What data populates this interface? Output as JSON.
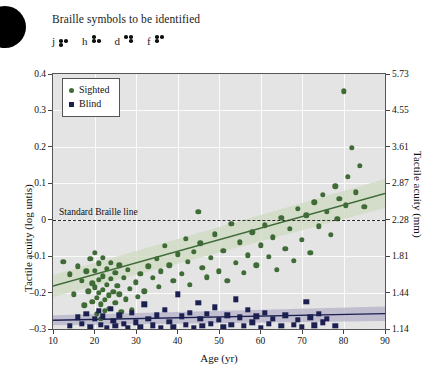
{
  "header": {
    "title": "Braille symbols to be identified",
    "braille_symbols": [
      {
        "letter": "j",
        "dots": [
          2,
          3,
          5
        ]
      },
      {
        "letter": "h",
        "dots": [
          1,
          2,
          5
        ]
      },
      {
        "letter": "d",
        "dots": [
          1,
          4,
          5
        ]
      },
      {
        "letter": "f",
        "dots": [
          1,
          2,
          4
        ]
      }
    ]
  },
  "legend": {
    "position": "top-left-inside",
    "items": [
      {
        "label": "Sighted",
        "marker": "circle",
        "color": "#3f6b36"
      },
      {
        "label": "Blind",
        "marker": "square",
        "color": "#1b2050"
      }
    ]
  },
  "annotation": {
    "braille_line_label": "Standard Braille line",
    "braille_line_y": 0
  },
  "colors": {
    "sighted": "#3f6b36",
    "sighted_band": "#cfdcc4",
    "blind": "#1b2050",
    "blind_band": "#b9b6cc",
    "plot_background": "#e4e4e4",
    "gridline": "#fbfbfb",
    "axis": "#555555"
  },
  "chart_data": {
    "type": "scatter",
    "title": "",
    "xlabel": "Age (yr)",
    "ylabel": "Tactile acuity (log untis)",
    "y2label": "Tactile acuity (mm)",
    "xlim": [
      10,
      90
    ],
    "ylim": [
      -0.3,
      0.4
    ],
    "grid": true,
    "xticks": [
      10,
      20,
      30,
      40,
      50,
      60,
      70,
      80,
      90
    ],
    "xticklabels": [
      "10",
      "20",
      "30",
      "40",
      "50",
      "60",
      "70",
      "80",
      "90"
    ],
    "yticks": [
      0.4,
      0.3,
      0.2,
      0.1,
      0,
      -0.1,
      -0.2,
      -0.3
    ],
    "yticklabels": [
      "0.4",
      "0.3",
      "0.2",
      "0.1",
      "0",
      "–0.1",
      "–0.2",
      "–0.3"
    ],
    "y2ticks": [
      0.4,
      0.3,
      0.2,
      0.1,
      0,
      -0.1,
      -0.2,
      -0.3
    ],
    "y2ticklabels": [
      "5.73",
      "4.55",
      "3.61",
      "2.87",
      "2.28",
      "1.81",
      "1.44",
      "1.14"
    ],
    "series": [
      {
        "name": "Sighted",
        "marker": "circle",
        "color": "#3f6b36",
        "trend": {
          "x": [
            10,
            90
          ],
          "y": [
            -0.182,
            0.072
          ]
        },
        "band_upper": {
          "x": [
            10,
            90
          ],
          "y": [
            -0.152,
            0.112
          ]
        },
        "band_lower": {
          "x": [
            10,
            90
          ],
          "y": [
            -0.212,
            0.032
          ]
        },
        "points": [
          [
            12.5,
            -0.115
          ],
          [
            14.0,
            -0.15
          ],
          [
            15.0,
            -0.205
          ],
          [
            16.0,
            -0.128
          ],
          [
            17.0,
            -0.168
          ],
          [
            17.5,
            -0.235
          ],
          [
            18.0,
            -0.142
          ],
          [
            18.5,
            -0.196
          ],
          [
            19.0,
            -0.108
          ],
          [
            19.5,
            -0.175
          ],
          [
            19.5,
            -0.225
          ],
          [
            20.0,
            -0.09
          ],
          [
            20.0,
            -0.14
          ],
          [
            20.0,
            -0.186
          ],
          [
            20.5,
            -0.215
          ],
          [
            20.5,
            -0.258
          ],
          [
            21.0,
            -0.12
          ],
          [
            21.0,
            -0.165
          ],
          [
            21.0,
            -0.2
          ],
          [
            21.5,
            -0.232
          ],
          [
            21.5,
            -0.272
          ],
          [
            22.0,
            -0.105
          ],
          [
            22.0,
            -0.155
          ],
          [
            22.0,
            -0.192
          ],
          [
            22.5,
            -0.22
          ],
          [
            22.5,
            -0.25
          ],
          [
            23.0,
            -0.135
          ],
          [
            23.0,
            -0.178
          ],
          [
            23.5,
            -0.208
          ],
          [
            23.5,
            -0.245
          ],
          [
            24.0,
            -0.118
          ],
          [
            24.0,
            -0.162
          ],
          [
            24.5,
            -0.198
          ],
          [
            25.0,
            -0.145
          ],
          [
            25.0,
            -0.228
          ],
          [
            25.5,
            -0.182
          ],
          [
            26.0,
            -0.125
          ],
          [
            26.0,
            -0.205
          ],
          [
            26.5,
            -0.252
          ],
          [
            27.0,
            -0.16
          ],
          [
            27.5,
            -0.218
          ],
          [
            28.0,
            -0.138
          ],
          [
            28.5,
            -0.19
          ],
          [
            29.0,
            -0.248
          ],
          [
            30.0,
            -0.172
          ],
          [
            30.5,
            -0.212
          ],
          [
            31.0,
            -0.148
          ],
          [
            32.0,
            -0.196
          ],
          [
            33.0,
            -0.128
          ],
          [
            34.0,
            -0.16
          ],
          [
            35.0,
            -0.108
          ],
          [
            35.5,
            -0.185
          ],
          [
            36.0,
            -0.142
          ],
          [
            37.0,
            -0.072
          ],
          [
            38.0,
            -0.125
          ],
          [
            39.0,
            -0.168
          ],
          [
            40.0,
            -0.095
          ],
          [
            41.0,
            -0.148
          ],
          [
            42.0,
            -0.052
          ],
          [
            42.5,
            -0.115
          ],
          [
            43.0,
            -0.178
          ],
          [
            44.0,
            -0.088
          ],
          [
            45.0,
            0.022
          ],
          [
            45.5,
            -0.065
          ],
          [
            46.0,
            -0.132
          ],
          [
            47.0,
            -0.158
          ],
          [
            48.0,
            -0.105
          ],
          [
            49.0,
            -0.04
          ],
          [
            50.0,
            -0.142
          ],
          [
            51.0,
            -0.085
          ],
          [
            52.0,
            -0.168
          ],
          [
            53.0,
            -0.012
          ],
          [
            54.0,
            -0.118
          ],
          [
            55.0,
            -0.062
          ],
          [
            56.0,
            -0.145
          ],
          [
            57.0,
            -0.098
          ],
          [
            58.0,
            -0.035
          ],
          [
            59.0,
            -0.125
          ],
          [
            60.0,
            -0.07
          ],
          [
            61.0,
            -0.015
          ],
          [
            62.0,
            -0.102
          ],
          [
            63.0,
            -0.048
          ],
          [
            64.0,
            -0.138
          ],
          [
            65.0,
            0.005
          ],
          [
            66.0,
            -0.08
          ],
          [
            67.0,
            -0.025
          ],
          [
            68.0,
            -0.112
          ],
          [
            69.0,
            0.03
          ],
          [
            70.0,
            -0.055
          ],
          [
            71.0,
            0.012
          ],
          [
            72.0,
            -0.09
          ],
          [
            73.0,
            0.048
          ],
          [
            74.0,
            -0.018
          ],
          [
            75.0,
            0.068
          ],
          [
            76.0,
            0.022
          ],
          [
            77.0,
            -0.042
          ],
          [
            78.0,
            0.092
          ],
          [
            78.5,
            0.002
          ],
          [
            79.0,
            0.058
          ],
          [
            80.0,
            0.352
          ],
          [
            80.5,
            0.04
          ],
          [
            81.0,
            0.118
          ],
          [
            82.0,
            0.198
          ],
          [
            83.0,
            0.075
          ],
          [
            84.0,
            0.148
          ],
          [
            85.0,
            0.035
          ]
        ]
      },
      {
        "name": "Blind",
        "marker": "square",
        "color": "#1b2050",
        "trend": {
          "x": [
            10,
            90
          ],
          "y": [
            -0.276,
            -0.258
          ]
        },
        "band_upper": {
          "x": [
            10,
            90
          ],
          "y": [
            -0.262,
            -0.238
          ]
        },
        "band_lower": {
          "x": [
            10,
            90
          ],
          "y": [
            -0.29,
            -0.278
          ]
        },
        "points": [
          [
            14.0,
            -0.292
          ],
          [
            16.0,
            -0.268
          ],
          [
            17.0,
            -0.285
          ],
          [
            18.0,
            -0.258
          ],
          [
            19.0,
            -0.295
          ],
          [
            20.0,
            -0.272
          ],
          [
            21.0,
            -0.25
          ],
          [
            21.5,
            -0.288
          ],
          [
            22.0,
            -0.265
          ],
          [
            23.0,
            -0.296
          ],
          [
            24.0,
            -0.245
          ],
          [
            24.5,
            -0.278
          ],
          [
            25.0,
            -0.292
          ],
          [
            26.0,
            -0.262
          ],
          [
            27.0,
            -0.285
          ],
          [
            28.0,
            -0.298
          ],
          [
            29.0,
            -0.255
          ],
          [
            30.0,
            -0.282
          ],
          [
            31.0,
            -0.295
          ],
          [
            32.0,
            -0.232
          ],
          [
            33.0,
            -0.272
          ],
          [
            34.0,
            -0.29
          ],
          [
            35.0,
            -0.262
          ],
          [
            36.0,
            -0.298
          ],
          [
            37.0,
            -0.248
          ],
          [
            38.0,
            -0.28
          ],
          [
            39.0,
            -0.294
          ],
          [
            40.0,
            -0.205
          ],
          [
            41.0,
            -0.265
          ],
          [
            42.0,
            -0.288
          ],
          [
            43.0,
            -0.255
          ],
          [
            44.0,
            -0.296
          ],
          [
            45.0,
            -0.228
          ],
          [
            45.5,
            -0.272
          ],
          [
            46.0,
            -0.292
          ],
          [
            47.0,
            -0.258
          ],
          [
            48.0,
            -0.285
          ],
          [
            49.0,
            -0.24
          ],
          [
            50.0,
            -0.275
          ],
          [
            51.0,
            -0.295
          ],
          [
            52.0,
            -0.262
          ],
          [
            53.0,
            -0.288
          ],
          [
            54.0,
            -0.218
          ],
          [
            55.0,
            -0.268
          ],
          [
            56.0,
            -0.292
          ],
          [
            57.0,
            -0.248
          ],
          [
            58.0,
            -0.282
          ],
          [
            59.0,
            -0.265
          ],
          [
            60.0,
            -0.296
          ],
          [
            61.0,
            -0.255
          ],
          [
            62.0,
            -0.285
          ],
          [
            63.0,
            -0.272
          ],
          [
            65.0,
            -0.292
          ],
          [
            66.0,
            -0.262
          ],
          [
            68.0,
            -0.288
          ],
          [
            69.0,
            -0.275
          ],
          [
            70.0,
            -0.295
          ],
          [
            71.0,
            -0.225
          ],
          [
            72.0,
            -0.268
          ],
          [
            73.0,
            -0.29
          ],
          [
            74.0,
            -0.258
          ],
          [
            75.0,
            -0.282
          ],
          [
            76.0,
            -0.272
          ],
          [
            78.0,
            -0.292
          ]
        ]
      }
    ]
  }
}
